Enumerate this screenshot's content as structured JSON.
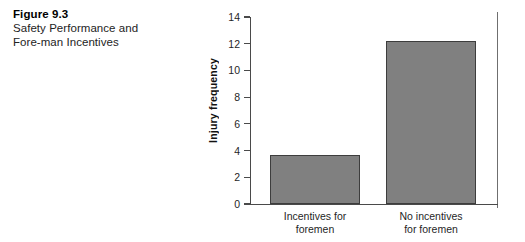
{
  "figure": {
    "number": "Figure 9.3",
    "title": "Safety Performance and Fore-man Incentives"
  },
  "chart_data": {
    "type": "bar",
    "title": "",
    "xlabel": "",
    "ylabel": "Injury frequency",
    "categories": [
      "Incentives for\nforemen",
      "No incentives\nfor foremen"
    ],
    "values": [
      3.65,
      12.2
    ],
    "ylim": [
      0,
      14
    ],
    "yticks": [
      0,
      2,
      4,
      6,
      8,
      10,
      12,
      14
    ],
    "ytick_labels": [
      "0",
      "2",
      "4",
      "6",
      "8",
      "10",
      "12",
      "14"
    ],
    "grid": false,
    "legend": null,
    "bar_color": "#808080",
    "bar_edge_color": "#3d3d3d",
    "axis_color": "#4a4a4a"
  }
}
